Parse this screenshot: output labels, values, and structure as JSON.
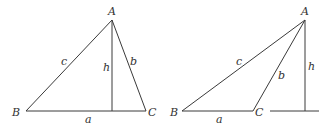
{
  "figures": [
    {
      "name": "acute-triangle",
      "vertices": {
        "A": "A",
        "B": "B",
        "C": "C"
      },
      "sides": {
        "a": "a",
        "b": "b",
        "c": "c"
      },
      "height": "h"
    },
    {
      "name": "obtuse-triangle",
      "vertices": {
        "A": "A",
        "B": "B",
        "C": "C"
      },
      "sides": {
        "a": "a",
        "b": "b",
        "c": "c"
      },
      "height": "h"
    }
  ]
}
